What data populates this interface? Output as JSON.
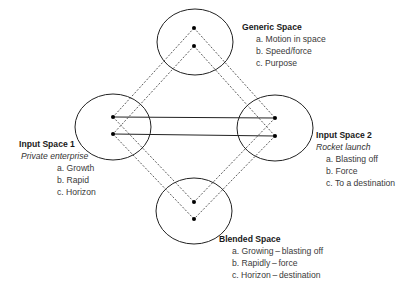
{
  "diagram": {
    "type": "conceptual-blending-network",
    "colors": {
      "line": "#222222",
      "dot": "#000000",
      "text": "#2a2a2a"
    },
    "spaces": {
      "generic": {
        "title": "Generic Space",
        "items": [
          "a. Motion in space",
          "b. Speed/force",
          "c. Purpose"
        ]
      },
      "input1": {
        "title": "Input Space 1",
        "subtitle": "Private enterprise",
        "items": [
          "a. Growth",
          "b. Rapid",
          "c. Horizon"
        ]
      },
      "input2": {
        "title": "Input Space 2",
        "subtitle": "Rocket launch",
        "items": [
          "a. Blasting off",
          "b. Force",
          "c. To a destination"
        ]
      },
      "blended": {
        "title": "Blended Space",
        "items": [
          "a. Growing – blasting off",
          "b. Rapidly – force",
          "c. Horizon – destination"
        ]
      }
    }
  }
}
